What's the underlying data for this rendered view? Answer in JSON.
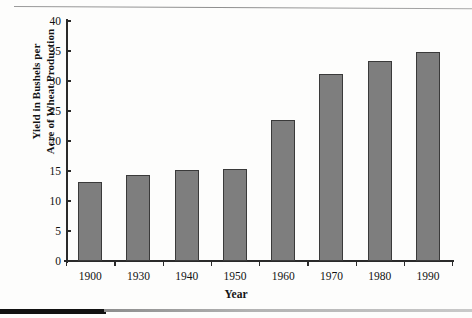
{
  "chart_data": {
    "type": "bar",
    "title": "",
    "xlabel": "Year",
    "ylabel": "Yield in Bushels per\nAcre of Wheat Production",
    "categories": [
      "1900",
      "1930",
      "1940",
      "1950",
      "1960",
      "1970",
      "1980",
      "1990"
    ],
    "values": [
      13.1,
      14.3,
      15.2,
      15.3,
      23.5,
      31.2,
      33.4,
      34.8
    ],
    "ylim": [
      0,
      40
    ],
    "yticks": [
      0,
      5,
      10,
      15,
      20,
      25,
      30,
      35,
      40
    ],
    "ytick_labels": [
      "0",
      "5",
      "10",
      "15",
      "20",
      "25",
      "30",
      "35",
      "40"
    ],
    "grid": false,
    "legend": null,
    "series_name": "Wheat yield",
    "bar_color": "#7e7e7e",
    "bar_edge_color": "#3a3a3a",
    "axis_color": "#2a2a2a"
  }
}
